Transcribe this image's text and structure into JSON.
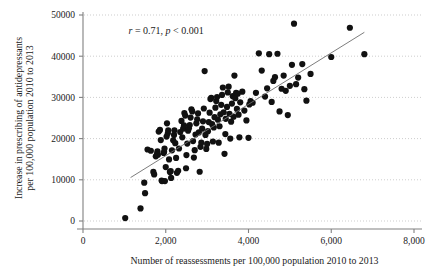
{
  "chart_data": {
    "type": "scatter",
    "title": "",
    "xlabel": "Number of reassessments per 100,000 population 2010 to 2013",
    "ylabel": "Increase in prescribing of antidepressants per 100,000 population 2010 to 2013",
    "ylabel_line1": "Increase in prescribing of antidepressants",
    "ylabel_line2": "per 100,000 population 2010 to 2013",
    "xlim": [
      0,
      8000
    ],
    "ylim": [
      0,
      50000
    ],
    "xticks": [
      0,
      2000,
      4000,
      6000,
      8000
    ],
    "xtick_labels": [
      "0",
      "2,000",
      "4,000",
      "6,000",
      "8,000"
    ],
    "yticks": [
      0,
      10000,
      20000,
      30000,
      40000,
      50000
    ],
    "ytick_labels": [
      "0",
      "10000",
      "20000",
      "30000",
      "40000",
      "50000"
    ],
    "grid": "horizontal-dotted",
    "legend": "none",
    "marker_color": "#111111",
    "marker_size": 3.1,
    "line_color": "#6e6e6e",
    "axis_color": "#808080",
    "grid_color": "#b9b9b9",
    "annotation": {
      "r_symbol": "r",
      "r_text": " = 0.71, ",
      "p_symbol": "p",
      "p_text": " < 0.001",
      "full_text": "r = 0.71, p < 0.001",
      "x": 1100,
      "y": 45500
    },
    "fit_line": {
      "name": "linear fit",
      "x_start": 1150,
      "y_start": 10550,
      "x_end": 6800,
      "y_end": 45800
    },
    "points": [
      [
        1020,
        700
      ],
      [
        1390,
        3050
      ],
      [
        1500,
        6750
      ],
      [
        1480,
        9300
      ],
      [
        1560,
        17350
      ],
      [
        1640,
        17050
      ],
      [
        1700,
        11900
      ],
      [
        1720,
        11300
      ],
      [
        1760,
        15700
      ],
      [
        1790,
        16300
      ],
      [
        1800,
        16900
      ],
      [
        1810,
        16100
      ],
      [
        1830,
        21700
      ],
      [
        1860,
        22100
      ],
      [
        1880,
        19650
      ],
      [
        1900,
        9800
      ],
      [
        1910,
        9700
      ],
      [
        1950,
        16500
      ],
      [
        1960,
        16800
      ],
      [
        1970,
        17600
      ],
      [
        1980,
        9700
      ],
      [
        2000,
        13100
      ],
      [
        2020,
        20500
      ],
      [
        2030,
        23700
      ],
      [
        2050,
        21300
      ],
      [
        2060,
        22000
      ],
      [
        2080,
        14950
      ],
      [
        2100,
        11900
      ],
      [
        2120,
        12100
      ],
      [
        2130,
        10450
      ],
      [
        2150,
        17150
      ],
      [
        2180,
        19600
      ],
      [
        2200,
        20900
      ],
      [
        2210,
        22000
      ],
      [
        2230,
        18900
      ],
      [
        2250,
        15300
      ],
      [
        2270,
        11700
      ],
      [
        2300,
        12200
      ],
      [
        2320,
        17600
      ],
      [
        2350,
        21600
      ],
      [
        2380,
        24300
      ],
      [
        2400,
        20300
      ],
      [
        2420,
        22400
      ],
      [
        2440,
        23200
      ],
      [
        2450,
        26200
      ],
      [
        2470,
        25600
      ],
      [
        2490,
        12800
      ],
      [
        2500,
        16000
      ],
      [
        2520,
        18800
      ],
      [
        2540,
        21900
      ],
      [
        2560,
        22500
      ],
      [
        2580,
        23300
      ],
      [
        2600,
        25100
      ],
      [
        2620,
        27100
      ],
      [
        2640,
        26600
      ],
      [
        2660,
        19400
      ],
      [
        2680,
        15400
      ],
      [
        2700,
        17200
      ],
      [
        2720,
        21000
      ],
      [
        2740,
        23700
      ],
      [
        2760,
        24700
      ],
      [
        2780,
        26100
      ],
      [
        2800,
        21500
      ],
      [
        2820,
        11950
      ],
      [
        2840,
        18000
      ],
      [
        2860,
        19000
      ],
      [
        2880,
        22400
      ],
      [
        2900,
        24200
      ],
      [
        2920,
        27300
      ],
      [
        2940,
        36400
      ],
      [
        2960,
        20900
      ],
      [
        2980,
        17500
      ],
      [
        3000,
        18700
      ],
      [
        3020,
        21800
      ],
      [
        3040,
        24000
      ],
      [
        3060,
        26300
      ],
      [
        3080,
        29600
      ],
      [
        3100,
        29900
      ],
      [
        3120,
        23500
      ],
      [
        3140,
        19300
      ],
      [
        3160,
        22700
      ],
      [
        3180,
        25200
      ],
      [
        3200,
        27500
      ],
      [
        3220,
        29100
      ],
      [
        3240,
        30100
      ],
      [
        3260,
        24600
      ],
      [
        3280,
        19000
      ],
      [
        3300,
        23000
      ],
      [
        3320,
        25900
      ],
      [
        3340,
        28200
      ],
      [
        3360,
        30600
      ],
      [
        3380,
        32400
      ],
      [
        3400,
        26400
      ],
      [
        3420,
        16300
      ],
      [
        3440,
        21100
      ],
      [
        3450,
        24800
      ],
      [
        3480,
        27700
      ],
      [
        3500,
        31200
      ],
      [
        3520,
        32600
      ],
      [
        3540,
        26000
      ],
      [
        3560,
        20000
      ],
      [
        3580,
        24100
      ],
      [
        3600,
        28500
      ],
      [
        3620,
        30300
      ],
      [
        3640,
        25300
      ],
      [
        3660,
        35300
      ],
      [
        3680,
        29800
      ],
      [
        3700,
        31100
      ],
      [
        3720,
        27200
      ],
      [
        3740,
        30900
      ],
      [
        3760,
        25800
      ],
      [
        3780,
        20300
      ],
      [
        3800,
        28800
      ],
      [
        3850,
        31400
      ],
      [
        3900,
        26800
      ],
      [
        3950,
        24400
      ],
      [
        4000,
        20200
      ],
      [
        4020,
        28300
      ],
      [
        4050,
        29100
      ],
      [
        4100,
        28700
      ],
      [
        4180,
        31100
      ],
      [
        4250,
        40700
      ],
      [
        4320,
        36500
      ],
      [
        4400,
        30200
      ],
      [
        4450,
        32200
      ],
      [
        4500,
        40500
      ],
      [
        4560,
        28900
      ],
      [
        4600,
        34000
      ],
      [
        4640,
        34900
      ],
      [
        4700,
        40600
      ],
      [
        4750,
        26600
      ],
      [
        4800,
        32100
      ],
      [
        4850,
        35300
      ],
      [
        4900,
        31600
      ],
      [
        4950,
        25700
      ],
      [
        5000,
        32800
      ],
      [
        5050,
        37900
      ],
      [
        5100,
        47900
      ],
      [
        5150,
        33200
      ],
      [
        5200,
        34800
      ],
      [
        5300,
        38100
      ],
      [
        5350,
        32000
      ],
      [
        5400,
        29200
      ],
      [
        5500,
        35700
      ],
      [
        6000,
        39800
      ],
      [
        6450,
        46900
      ],
      [
        6800,
        40500
      ]
    ]
  }
}
